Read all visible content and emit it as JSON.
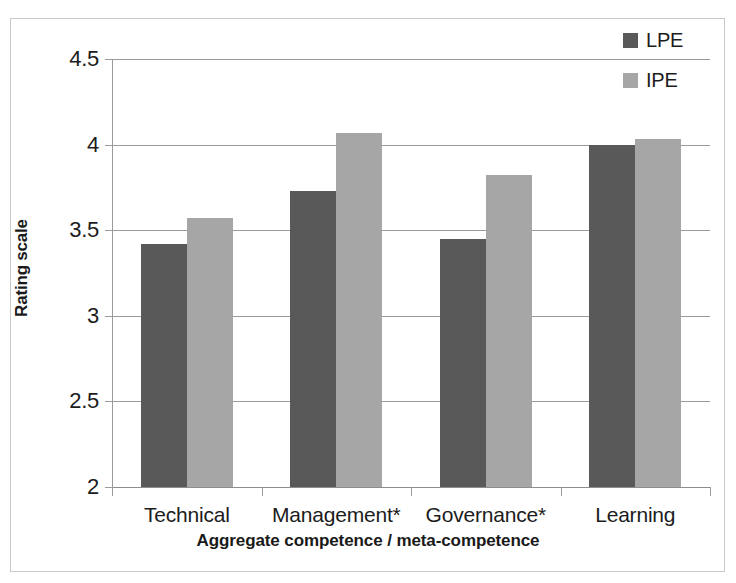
{
  "chart_data": {
    "type": "bar",
    "title": "",
    "xlabel": "Aggregate competence / meta-competence",
    "ylabel": "Rating scale",
    "categories": [
      "Technical",
      "Management*",
      "Governance*",
      "Learning"
    ],
    "series": [
      {
        "name": "LPE",
        "color": "#595959",
        "values": [
          3.42,
          3.73,
          3.45,
          4.0
        ]
      },
      {
        "name": "IPE",
        "color": "#a6a6a6",
        "values": [
          3.57,
          4.07,
          3.82,
          4.03
        ]
      }
    ],
    "ylim": [
      2,
      4.5
    ],
    "yticks": [
      "2",
      "2.5",
      "3",
      "3.5",
      "4",
      "4.5"
    ],
    "ytick_values": [
      2,
      2.5,
      3,
      3.5,
      4,
      4.5
    ],
    "grid": true,
    "legend_position": "top-right",
    "annotations": [
      "* denotes statistically significant difference"
    ]
  },
  "legend": {
    "entries": [
      {
        "label": "LPE",
        "color": "#595959"
      },
      {
        "label": "IPE",
        "color": "#a6a6a6"
      }
    ]
  },
  "axes": {
    "y_title": "Rating scale",
    "x_title": "Aggregate competence / meta-competence"
  },
  "colors": {
    "series_lpe": "#595959",
    "series_ipe": "#a6a6a6",
    "gridline": "#9a9a9a",
    "frame": "#c9c9c9",
    "text": "#1c1c1c",
    "background": "#ffffff"
  }
}
